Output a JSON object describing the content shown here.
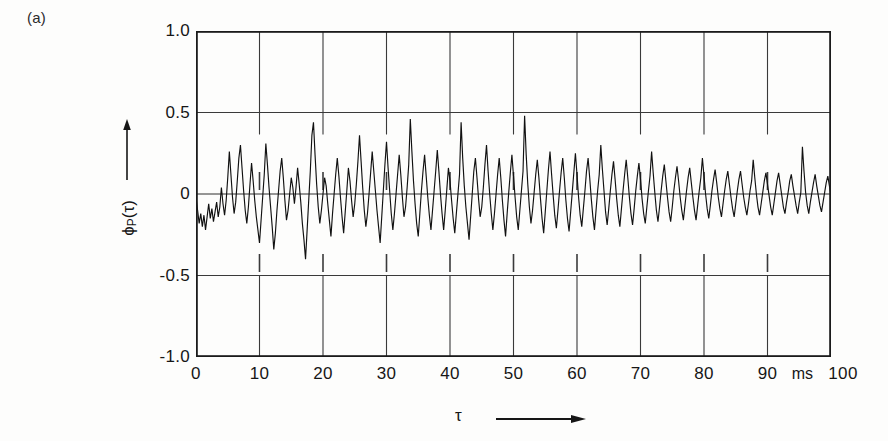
{
  "panel": {
    "label": "(a)"
  },
  "axes": {
    "y": {
      "title_main": "ϕ",
      "title_sub": "P",
      "title_tail": "(τ)",
      "arrow_icon": "up-arrow-icon",
      "ticks": [
        "1.0",
        "0.5",
        "0",
        "-0.5",
        "-1.0"
      ],
      "tick_values": [
        1.0,
        0.5,
        0,
        -0.5,
        -1.0
      ]
    },
    "x": {
      "title": "τ",
      "arrow_icon": "right-arrow-icon",
      "unit": "ms",
      "ticks": [
        "0",
        "10",
        "20",
        "30",
        "40",
        "50",
        "60",
        "70",
        "80",
        "90",
        "100"
      ],
      "tick_values": [
        0,
        10,
        20,
        30,
        40,
        50,
        60,
        70,
        80,
        90,
        100
      ]
    }
  },
  "style": {
    "trace_color": "#111111",
    "frame_color": "#1b1b1b",
    "grid_color": "#3a3a3a",
    "zero_line_color": "#2e2e2e",
    "background": "#fdfdfc"
  },
  "chart_data": {
    "type": "line",
    "title": "(a)",
    "subtitle": "",
    "xlabel": "τ",
    "ylabel": "ϕ_P(τ)",
    "xunit": "ms",
    "xlim": [
      0,
      100
    ],
    "ylim": [
      -1.0,
      1.0
    ],
    "xticks": [
      0,
      10,
      20,
      30,
      40,
      50,
      60,
      70,
      80,
      90,
      100
    ],
    "yticks": [
      -1.0,
      -0.5,
      0,
      0.5,
      1.0
    ],
    "grid": true,
    "legend": null,
    "series": [
      {
        "name": "ϕ_P(τ)",
        "description": "Noisy autocorrelation function of speech/pitch signal, amplitude decaying with lag",
        "x_start": 0,
        "x_step": 0.25,
        "values": [
          -0.02,
          -0.1,
          -0.18,
          -0.12,
          -0.2,
          -0.13,
          -0.22,
          -0.14,
          -0.06,
          -0.15,
          -0.09,
          -0.17,
          -0.11,
          -0.05,
          -0.14,
          -0.08,
          0.04,
          -0.06,
          -0.13,
          -0.04,
          0.1,
          0.26,
          0.12,
          -0.02,
          -0.12,
          -0.05,
          0.08,
          0.22,
          0.3,
          0.16,
          0.02,
          -0.1,
          -0.18,
          -0.08,
          0.06,
          0.19,
          0.08,
          -0.04,
          -0.14,
          -0.22,
          -0.3,
          -0.16,
          -0.02,
          0.12,
          0.31,
          0.18,
          0.04,
          -0.08,
          -0.2,
          -0.34,
          -0.24,
          -0.1,
          0.02,
          0.14,
          0.22,
          0.1,
          -0.04,
          -0.16,
          -0.1,
          0.0,
          0.1,
          0.04,
          -0.06,
          0.04,
          0.16,
          0.06,
          -0.05,
          -0.18,
          -0.28,
          -0.4,
          -0.22,
          -0.04,
          0.14,
          0.36,
          0.44,
          0.24,
          0.06,
          -0.08,
          -0.18,
          -0.1,
          0.0,
          0.1,
          0.05,
          -0.06,
          -0.16,
          -0.26,
          -0.12,
          0.0,
          0.12,
          0.22,
          0.11,
          -0.02,
          -0.14,
          -0.24,
          -0.11,
          0.02,
          0.16,
          0.08,
          -0.04,
          -0.14,
          -0.06,
          0.06,
          0.2,
          0.36,
          0.2,
          0.04,
          -0.1,
          -0.2,
          -0.12,
          0.0,
          0.13,
          0.26,
          0.14,
          0.02,
          -0.1,
          -0.2,
          -0.3,
          -0.14,
          0.02,
          0.18,
          0.32,
          0.16,
          0.02,
          -0.12,
          -0.22,
          -0.12,
          0.0,
          0.12,
          0.24,
          0.12,
          -0.02,
          -0.14,
          -0.08,
          0.04,
          0.18,
          0.46,
          0.26,
          0.08,
          -0.06,
          -0.18,
          -0.26,
          -0.12,
          0.02,
          0.14,
          0.24,
          0.11,
          -0.02,
          -0.13,
          -0.22,
          -0.1,
          0.02,
          0.14,
          0.27,
          0.14,
          0.0,
          -0.12,
          -0.22,
          -0.1,
          0.03,
          0.16,
          0.08,
          -0.04,
          -0.15,
          -0.24,
          -0.12,
          0.0,
          0.12,
          0.44,
          0.22,
          0.05,
          -0.08,
          -0.18,
          -0.28,
          -0.14,
          0.0,
          0.14,
          0.22,
          0.1,
          -0.03,
          -0.14,
          -0.08,
          0.04,
          0.18,
          0.3,
          0.14,
          0.0,
          -0.12,
          -0.22,
          -0.12,
          0.0,
          0.12,
          0.22,
          0.1,
          -0.04,
          -0.16,
          -0.26,
          -0.12,
          0.01,
          0.13,
          0.24,
          0.11,
          -0.02,
          -0.14,
          -0.22,
          -0.1,
          0.02,
          0.14,
          0.48,
          0.24,
          0.06,
          -0.08,
          -0.18,
          -0.1,
          0.01,
          0.12,
          0.21,
          0.1,
          -0.03,
          -0.15,
          -0.24,
          -0.11,
          0.02,
          0.15,
          0.26,
          0.12,
          -0.01,
          -0.13,
          -0.21,
          -0.1,
          0.02,
          0.13,
          0.22,
          0.1,
          -0.04,
          -0.15,
          -0.23,
          -0.11,
          0.01,
          0.13,
          0.25,
          0.12,
          -0.02,
          -0.13,
          -0.2,
          -0.09,
          0.02,
          0.14,
          0.22,
          0.1,
          -0.03,
          -0.14,
          -0.22,
          -0.1,
          0.02,
          0.12,
          0.3,
          0.15,
          0.02,
          -0.11,
          -0.19,
          -0.09,
          0.02,
          0.12,
          0.2,
          0.09,
          -0.03,
          -0.13,
          -0.2,
          -0.09,
          0.02,
          0.12,
          0.21,
          0.1,
          -0.02,
          -0.12,
          -0.19,
          -0.09,
          0.02,
          0.11,
          0.19,
          0.09,
          -0.03,
          -0.12,
          -0.18,
          -0.08,
          0.02,
          0.11,
          0.26,
          0.13,
          0.01,
          -0.1,
          -0.17,
          -0.08,
          0.02,
          0.11,
          0.18,
          0.08,
          -0.02,
          -0.11,
          -0.17,
          -0.08,
          0.02,
          0.1,
          0.17,
          0.08,
          -0.02,
          -0.1,
          -0.16,
          -0.07,
          0.02,
          0.1,
          0.16,
          0.07,
          -0.02,
          -0.1,
          -0.16,
          -0.07,
          0.02,
          0.1,
          0.22,
          0.11,
          0.0,
          -0.09,
          -0.15,
          -0.07,
          0.02,
          0.09,
          0.15,
          0.07,
          -0.02,
          -0.09,
          -0.14,
          -0.06,
          0.02,
          0.09,
          0.14,
          0.06,
          -0.02,
          -0.09,
          -0.14,
          -0.06,
          0.02,
          0.09,
          0.14,
          0.06,
          -0.02,
          -0.08,
          -0.13,
          -0.06,
          0.02,
          0.08,
          0.21,
          0.1,
          0.0,
          -0.08,
          -0.13,
          -0.06,
          0.01,
          0.08,
          0.13,
          0.06,
          -0.01,
          -0.08,
          -0.13,
          -0.06,
          0.01,
          0.08,
          0.13,
          0.06,
          -0.01,
          -0.08,
          -0.12,
          -0.05,
          0.01,
          0.08,
          0.12,
          0.05,
          -0.01,
          -0.07,
          -0.12,
          -0.05,
          0.01,
          0.29,
          0.14,
          0.01,
          -0.07,
          -0.12,
          -0.05,
          0.01,
          0.07,
          0.12,
          0.05,
          -0.01,
          -0.07,
          -0.11,
          -0.05,
          0.01,
          0.07,
          0.11,
          0.05,
          -0.01,
          -0.07,
          -0.11,
          -0.05,
          0.01,
          0.07,
          0.11,
          0.05,
          -0.01,
          -0.07,
          -0.11,
          -0.05,
          0.01,
          0.07,
          0.18,
          0.09,
          0.0,
          -0.06,
          -0.1,
          -0.04,
          0.01,
          0.06,
          0.1,
          0.04,
          -0.01,
          -0.06,
          -0.1,
          -0.04,
          0.01,
          0.06,
          0.1,
          0.04,
          -0.01,
          -0.06,
          -0.1,
          -0.04,
          0.01,
          0.2,
          0.09,
          0.0,
          -0.06,
          -0.1,
          -0.04,
          0.01,
          0.06,
          0.09,
          0.04,
          -0.01,
          -0.06,
          -0.09,
          -0.04,
          0.01,
          0.06,
          0.09,
          0.04,
          -0.01,
          -0.05,
          -0.09,
          -0.04,
          0.01,
          0.05,
          0.09,
          0.04,
          -0.01,
          -0.05,
          -0.09,
          -0.04,
          0.01,
          0.05,
          0.09,
          0.04,
          -0.01,
          -0.05,
          -0.08,
          -0.03,
          0.01,
          0.05,
          0.08,
          0.03,
          -0.01,
          -0.05,
          -0.08,
          -0.03,
          0.01,
          0.05,
          0.08,
          0.03,
          -0.01,
          -0.05,
          -0.08,
          -0.03,
          0.01,
          0.05,
          0.08,
          0.03,
          -0.01,
          -0.05,
          -0.08,
          -0.03,
          0.01,
          0.05,
          0.07,
          0.03,
          -0.01,
          -0.04,
          -0.07,
          -0.03,
          0.01,
          0.04,
          0.07,
          0.03,
          -0.01,
          -0.04,
          -0.07,
          -0.03,
          0.01,
          0.04,
          0.07,
          0.03,
          -0.01,
          -0.04,
          -0.07,
          -0.03,
          0.01,
          0.04,
          0.07,
          0.03,
          -0.01,
          -0.04,
          -0.06,
          -0.02,
          0.01,
          0.04,
          0.06,
          0.02,
          -0.01,
          -0.04,
          -0.06,
          -0.02,
          0.0,
          0.04,
          0.06,
          0.02,
          -0.01,
          -0.03,
          -0.06,
          -0.02,
          0.0,
          0.03,
          0.06,
          0.02,
          -0.01,
          -0.03,
          -0.05,
          -0.02,
          0.0,
          0.03,
          0.05,
          0.02,
          -0.02
        ]
      }
    ]
  }
}
